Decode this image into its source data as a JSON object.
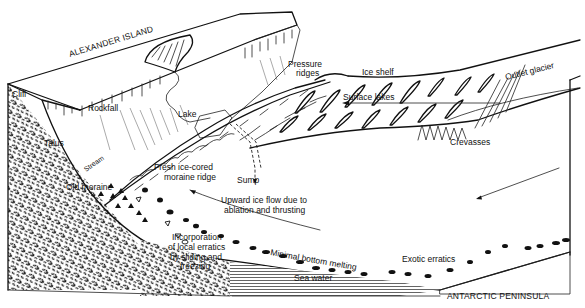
{
  "figure": {
    "colors": {
      "ink": "#111111",
      "background": "#ffffff"
    }
  },
  "labels": {
    "alexander_island": "ALEXANDER ISLAND",
    "antarctic_peninsula": "ANTARCTIC PENINSULA",
    "cliff": "Cliff",
    "rockfall": "Rockfall",
    "talus": "Talus",
    "stream": "Stream",
    "old_moraine": "Old moraine",
    "lake": "Lake",
    "pressure_ridges_1": "Pressure",
    "pressure_ridges_2": "ridges",
    "ice_shelf": "Ice shelf",
    "outlet_glacier": "Outlet glacier",
    "surface_lakes": "Surface lakes",
    "crevasses": "Crevasses",
    "fresh_moraine_1": "Fresh ice-cored",
    "fresh_moraine_2": "moraine ridge",
    "sump": "Sump",
    "upward_flow_1": "Upward ice flow due to",
    "upward_flow_2": "ablation and thrusting",
    "incorporation_1": "Incorporation",
    "incorporation_2": "of local erratics",
    "incorporation_3": "by  sliding and",
    "incorporation_4": "freezing",
    "minimal_melting": "Minimal bottom melting",
    "sea_water": "Sea water",
    "exotic_erratics": "Exotic erratics"
  },
  "icons": {
    "flow_arrow": "arrow-left",
    "sump_arrow": "arrow-down"
  }
}
